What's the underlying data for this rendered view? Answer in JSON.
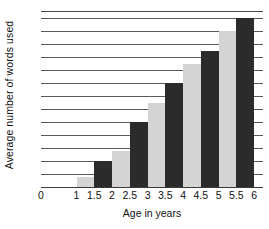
{
  "chart_data": {
    "type": "bar",
    "title": "",
    "xlabel": "Age in years",
    "ylabel": "Average number of words used",
    "grid": true,
    "legend": "none",
    "xlim": [
      0,
      6.25
    ],
    "ylim": [
      0,
      2700
    ],
    "x_tick_labels": [
      "0",
      "1",
      "1.5",
      "2",
      "2.5",
      "3",
      "3.5",
      "4",
      "4.5",
      "5",
      "5.5",
      "6"
    ],
    "x_tick_values": [
      0,
      1,
      1.5,
      2,
      2.5,
      3,
      3.5,
      4,
      4.5,
      5,
      5.5,
      6
    ],
    "y_tick_labels": [
      "2600",
      "2400",
      "2200",
      "2000",
      "1800",
      "1600",
      "1400",
      "1200",
      "1000",
      "800",
      "600",
      "400",
      "200"
    ],
    "y_tick_values": [
      2600,
      2400,
      2200,
      2000,
      1800,
      1600,
      1400,
      1200,
      1000,
      800,
      600,
      400,
      200
    ],
    "categories": [
      "1.5",
      "2",
      "2.5",
      "3",
      "3.5",
      "4",
      "4.5",
      "5",
      "5.5",
      "6"
    ],
    "values": [
      150,
      400,
      550,
      1000,
      1300,
      1600,
      1900,
      2100,
      2400,
      2600
    ],
    "bar_colors": [
      "#d4d4d4",
      "#2b2b2b",
      "#d4d4d4",
      "#2b2b2b",
      "#d4d4d4",
      "#2b2b2b",
      "#d4d4d4",
      "#2b2b2b",
      "#d4d4d4",
      "#2b2b2b"
    ],
    "colors": {
      "light_bar": "#d4d4d4",
      "dark_bar": "#2b2b2b",
      "gridline": "#5a5a5a",
      "axis": "#3a3a3a",
      "text": "#111111",
      "background": "#ffffff"
    }
  }
}
